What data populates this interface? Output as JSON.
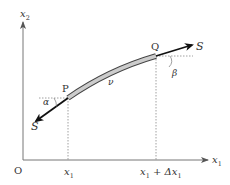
{
  "diagram": {
    "axes": {
      "x_label": "x",
      "x_label_sub": "1",
      "y_label": "x",
      "y_label_sub": "2",
      "origin_label": "O"
    },
    "points": {
      "p_label": "P",
      "q_label": "Q"
    },
    "tick_labels": {
      "x1": "x",
      "x1_sub": "1",
      "x1_dx_a": "x",
      "x1_dx_a_sub": "1",
      "x1_dx_plus": " + ",
      "x1_dx_delta": "Δx",
      "x1_dx_delta_sub": "1"
    },
    "forces": {
      "left_label": "S",
      "right_label": "S"
    },
    "angles": {
      "alpha": "α",
      "beta": "β"
    },
    "segment_label": "ν",
    "colors": {
      "line": "#333333",
      "arrow": "#111111",
      "string_fill": "#cccccc",
      "dotted": "#888888"
    }
  }
}
